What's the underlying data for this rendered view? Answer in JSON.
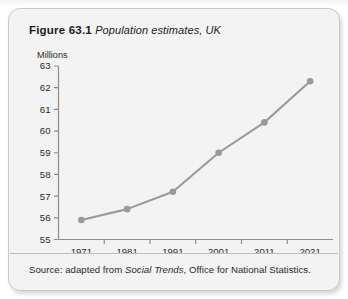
{
  "figure": {
    "number": "Figure 63.1",
    "caption": "Population estimates, UK",
    "source_prefix": "Source: adapted from ",
    "source_italic": "Social Trends",
    "source_suffix": ", Office for National Statistics."
  },
  "colors": {
    "card_background": "#f3f3f3",
    "card_border": "#c9c9c9",
    "axis": "#8d8d8d",
    "series_line": "#9a9a9a",
    "series_marker": "#9a9a9a",
    "text": "#1b1b1b"
  },
  "chart_data": {
    "type": "line",
    "title": "Population estimates, UK",
    "xlabel": "",
    "ylabel": "Millions",
    "categories": [
      "1971",
      "1981",
      "1991",
      "2001",
      "2011",
      "2021"
    ],
    "values": [
      55.9,
      56.4,
      57.2,
      59.0,
      60.4,
      62.3
    ],
    "series": [
      {
        "name": "UK population",
        "values": [
          55.9,
          56.4,
          57.2,
          59.0,
          60.4,
          62.3
        ]
      }
    ],
    "ylim": [
      55,
      63
    ],
    "ytick_labels": [
      "63",
      "62",
      "61",
      "60",
      "59",
      "58",
      "57",
      "56",
      "55"
    ],
    "ytick_values": [
      63,
      62,
      61,
      60,
      59,
      58,
      57,
      56,
      55
    ],
    "xtick_labels": [
      "1971",
      "1981",
      "1991",
      "2001",
      "2011",
      "2021"
    ],
    "grid": false,
    "legend": "none",
    "markers": true,
    "units": "Millions"
  }
}
